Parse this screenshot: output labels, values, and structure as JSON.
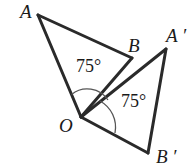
{
  "diagram": {
    "type": "geometry-rotation",
    "points": {
      "A": {
        "label": "A",
        "x": 38,
        "y": 15
      },
      "B": {
        "label": "B",
        "x": 132,
        "y": 58
      },
      "O": {
        "label": "O",
        "x": 81,
        "y": 117
      },
      "A_prime": {
        "label": "A ′",
        "x": 166,
        "y": 49
      },
      "B_prime": {
        "label": "B ′",
        "x": 148,
        "y": 153
      }
    },
    "angles": {
      "AOB": {
        "label": "75°"
      },
      "BOB_prime": {
        "label": "75°"
      }
    },
    "colors": {
      "stroke": "#2a2a2a",
      "text": "#1a1a1a"
    }
  }
}
